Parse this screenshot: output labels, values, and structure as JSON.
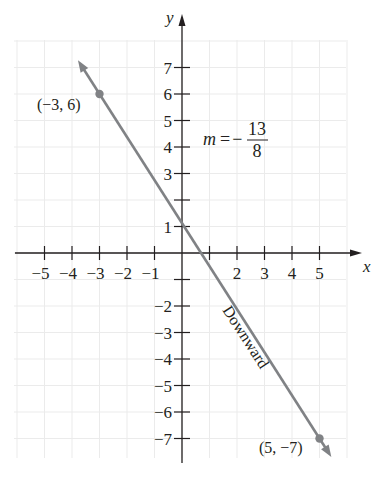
{
  "chart_data": {
    "type": "line",
    "title": "",
    "xlabel": "x",
    "ylabel": "y",
    "xlim": [
      -5.5,
      6
    ],
    "ylim": [
      -8,
      8.5
    ],
    "grid": true,
    "x_ticks": [
      -5,
      -4,
      -3,
      -2,
      -1,
      1,
      2,
      3,
      4,
      5
    ],
    "x_tick_labels": [
      "−5",
      "−4",
      "−3",
      "−2",
      "−1",
      "",
      "2",
      "3",
      "4",
      "5"
    ],
    "y_ticks": [
      7,
      6,
      5,
      4,
      3,
      2,
      1,
      -1,
      -2,
      -3,
      -4,
      -5,
      -6,
      -7
    ],
    "y_tick_labels": [
      "7",
      "6",
      "5",
      "4",
      "3",
      "",
      "1",
      "",
      "−2",
      "−3",
      "−4",
      "−5",
      "−6",
      "−7"
    ],
    "series": [
      {
        "name": "line through (−3, 6) and (5, −7)",
        "slope": "-13/8",
        "points": [
          {
            "x": -3,
            "y": 6
          },
          {
            "x": 5,
            "y": -7
          }
        ],
        "color": "#808285"
      }
    ],
    "annotations": [
      {
        "text": "(−3, 6)",
        "x": -3,
        "y": 6
      },
      {
        "text": "(5, −7)",
        "x": 5,
        "y": -7
      },
      {
        "text": "m = −13/8",
        "position": "upper right of y-axis"
      },
      {
        "text": "Downward",
        "position": "along line, rotated"
      }
    ]
  },
  "labels": {
    "x_axis": "x",
    "y_axis": "y",
    "point_a": "(−3, 6)",
    "point_b": "(5, −7)",
    "slope_prefix": "m = −",
    "slope_num": "13",
    "slope_den": "8",
    "direction": "Downward"
  },
  "colors": {
    "line": "#808285",
    "axis": "#231f20",
    "grid": "#ececec"
  }
}
